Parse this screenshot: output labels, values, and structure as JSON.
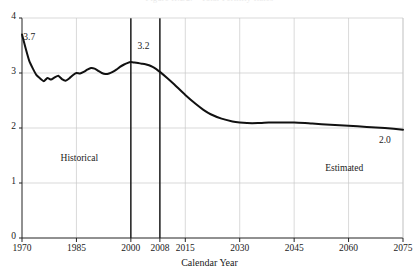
{
  "chart_data": {
    "type": "line",
    "title": "Figure II.D2.—Total Fertility Rates",
    "xlabel": "Calendar Year",
    "ylabel": "",
    "xlim": [
      1970,
      2075
    ],
    "ylim": [
      0,
      4
    ],
    "grid": true,
    "legend": "none",
    "xticks": [
      1970,
      1985,
      2000,
      2008,
      2015,
      2030,
      2045,
      2060,
      2075
    ],
    "xtick_labels": [
      "1970",
      "1985",
      "2000",
      "2008",
      "2015",
      "2030",
      "2045",
      "2060",
      "2075"
    ],
    "yticks": [
      0,
      1,
      2,
      3,
      4
    ],
    "ytick_labels": [
      "0",
      "1",
      "2",
      "3",
      "4"
    ],
    "annotations": [
      {
        "text": "3.7",
        "x": 1971,
        "y": 3.62,
        "name": "start-value-label"
      },
      {
        "text": "3.2",
        "x": 2002.5,
        "y": 3.46,
        "name": "peak-value-label"
      },
      {
        "text": "2.0",
        "x": 2069,
        "y": 1.74,
        "name": "end-value-label"
      },
      {
        "text": "Historical",
        "x": 1982,
        "y": 1.42,
        "name": "historical-region-label"
      },
      {
        "text": "Estimated",
        "x": 2055,
        "y": 1.24,
        "name": "estimated-region-label"
      }
    ],
    "vertical_markers": [
      {
        "x": 2000,
        "name": "marker-2000"
      },
      {
        "x": 2008,
        "name": "marker-2008"
      }
    ],
    "series": [
      {
        "name": "Total fertility rate",
        "color": "#111111",
        "x": [
          1970,
          1971,
          1972,
          1973,
          1974,
          1975,
          1976,
          1977,
          1978,
          1979,
          1980,
          1981,
          1982,
          1983,
          1984,
          1985,
          1986,
          1987,
          1988,
          1989,
          1990,
          1991,
          1992,
          1993,
          1994,
          1995,
          1996,
          1997,
          1998,
          1999,
          2000,
          2001,
          2002,
          2003,
          2004,
          2005,
          2006,
          2007,
          2008,
          2010,
          2012,
          2015,
          2018,
          2020,
          2022,
          2025,
          2028,
          2030,
          2032,
          2035,
          2038,
          2040,
          2042,
          2045,
          2048,
          2050,
          2055,
          2060,
          2065,
          2070,
          2075
        ],
        "y": [
          3.7,
          3.45,
          3.22,
          3.08,
          2.96,
          2.9,
          2.85,
          2.91,
          2.88,
          2.92,
          2.95,
          2.89,
          2.86,
          2.9,
          2.96,
          3.0,
          2.99,
          3.02,
          3.06,
          3.09,
          3.08,
          3.04,
          3.0,
          2.98,
          2.99,
          3.02,
          3.06,
          3.11,
          3.15,
          3.18,
          3.2,
          3.19,
          3.18,
          3.17,
          3.16,
          3.14,
          3.11,
          3.07,
          3.02,
          2.91,
          2.79,
          2.6,
          2.43,
          2.33,
          2.25,
          2.17,
          2.12,
          2.1,
          2.09,
          2.09,
          2.1,
          2.1,
          2.1,
          2.1,
          2.09,
          2.08,
          2.06,
          2.04,
          2.02,
          2.0,
          1.97
        ]
      }
    ]
  },
  "axes_geometry": {
    "plot_left": 22,
    "plot_right": 403,
    "plot_top": 18,
    "plot_bottom": 238
  }
}
